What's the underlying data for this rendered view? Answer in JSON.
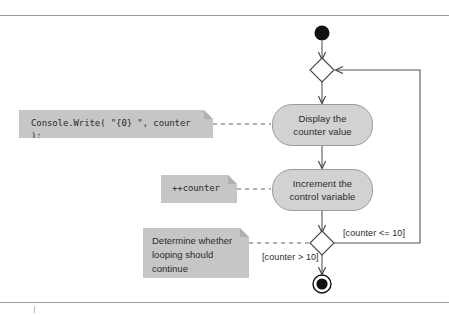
{
  "diagram": {
    "type": "uml-activity-diagram",
    "nodes": {
      "start": {
        "label": "",
        "kind": "initial-node"
      },
      "merge": {
        "label": "",
        "kind": "merge-node"
      },
      "action_display": {
        "label": "Display the\ncounter value",
        "kind": "action-state"
      },
      "action_increment": {
        "label": "Increment the\ncontrol variable",
        "kind": "action-state"
      },
      "decision": {
        "label": "",
        "kind": "decision-node"
      },
      "final": {
        "label": "",
        "kind": "final-node"
      }
    },
    "notes": {
      "write_note": {
        "text": "Console.Write( \"{0}  \", counter );",
        "style": "code"
      },
      "increment_note": {
        "text": "++counter",
        "style": "code"
      },
      "decision_note": {
        "text": "Determine whether\nlooping should\ncontinue",
        "style": "prose"
      }
    },
    "guards": {
      "loop_back": "[counter <= 10]",
      "exit": "[counter > 10]"
    },
    "colors": {
      "action_fill": "#d2d2d2",
      "action_stroke": "#9c9c9c",
      "note_fill": "#c6c6c6",
      "note_fold": "#b0b0b0",
      "line": "#555555",
      "rule": "#9a9a9a",
      "text": "#2b2b2b",
      "node_fill": "#000000"
    }
  }
}
